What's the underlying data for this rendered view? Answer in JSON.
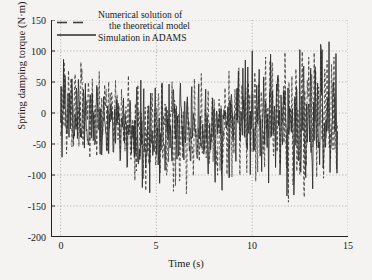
{
  "chart_data": {
    "type": "line",
    "title": "",
    "xlabel": "Time (s)",
    "ylabel": "Spring damping torque (N·m)",
    "xlim": [
      -0.5,
      15
    ],
    "ylim": [
      -200,
      150
    ],
    "xticks": [
      "0",
      "5",
      "10",
      "15"
    ],
    "xtick_values": [
      0,
      5,
      10,
      15
    ],
    "yticks": [
      "150",
      "100",
      "50",
      "0",
      "-50",
      "-100",
      "-150",
      "-200"
    ],
    "ytick_values": [
      150,
      100,
      50,
      0,
      -50,
      -100,
      -150,
      -200
    ],
    "grid": true,
    "grid_style": "dotted",
    "legend_position": "top-left",
    "series": [
      {
        "name": "Numerical solution of the theoretical model",
        "style": "dashed",
        "color": "#3f3f3f",
        "x_start": 0.0,
        "x_end": 14.45,
        "n_points": 560,
        "description": "High-frequency multi-modal oscillation about a slowly drifting mean near -10 N·m; envelope grows from about +95/-90 at t=0 to about +120/-155 near t=14.",
        "envelope_upper": [
          95,
          88,
          70,
          62,
          52,
          48,
          62,
          60,
          68,
          76,
          88,
          96,
          106,
          112,
          120
        ],
        "envelope_lower": [
          -90,
          -86,
          -80,
          -82,
          -128,
          -132,
          -126,
          -120,
          -108,
          -104,
          -118,
          -136,
          -155,
          -150,
          -140
        ]
      },
      {
        "name": "Simulation in ADAMS",
        "style": "solid",
        "color": "#2b2b2b",
        "x_start": 0.0,
        "x_end": 14.45,
        "n_points": 560,
        "description": "Nearly coincident with the theoretical trace, slightly phase-shifted and marginally larger in peak amplitude.",
        "envelope_upper": [
          92,
          84,
          72,
          60,
          54,
          50,
          64,
          58,
          66,
          78,
          90,
          98,
          104,
          115,
          118
        ],
        "envelope_lower": [
          -88,
          -84,
          -78,
          -80,
          -130,
          -128,
          -124,
          -118,
          -110,
          -100,
          -116,
          -132,
          -150,
          -148,
          -136
        ]
      }
    ],
    "annotations": []
  },
  "legend": {
    "line1": "Numerical solution of",
    "line2": "the theoretical model",
    "line3": "Simulation in ADAMS"
  }
}
